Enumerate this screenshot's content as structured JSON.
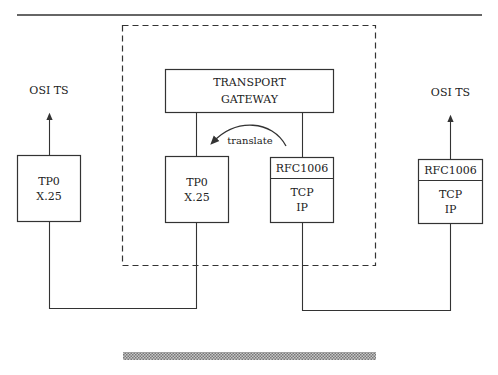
{
  "diagram": {
    "left_endpoint": {
      "service_label": "OSI TS",
      "lines": [
        "TP0",
        "X.25"
      ]
    },
    "gateway": {
      "title_lines": [
        "TRANSPORT",
        "GATEWAY"
      ],
      "left_stack": {
        "lines": [
          "TP0",
          "X.25"
        ]
      },
      "right_stack": {
        "header": "RFC1006",
        "lines": [
          "TCP",
          "IP"
        ]
      },
      "translate_label": "translate"
    },
    "right_endpoint": {
      "service_label": "OSI TS",
      "header": "RFC1006",
      "lines": [
        "TCP",
        "IP"
      ]
    },
    "colors": {
      "stroke": "#333333",
      "hatch": "#9a9a9a"
    }
  }
}
